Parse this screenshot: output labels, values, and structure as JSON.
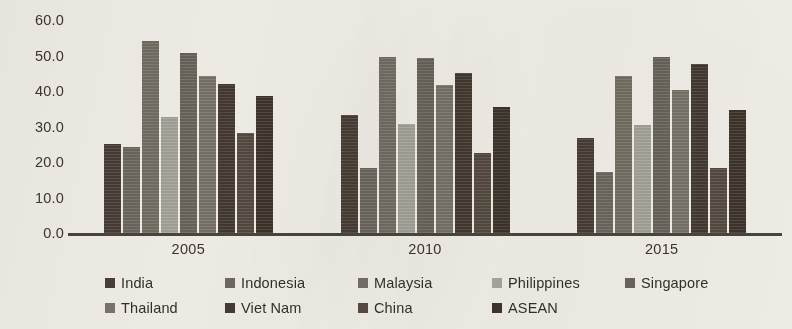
{
  "chart_data": {
    "type": "bar",
    "title": "",
    "subtitle": "",
    "xlabel": "",
    "ylabel": "",
    "categories": [
      "2005",
      "2010",
      "2015"
    ],
    "ylim": [
      0,
      60
    ],
    "ytick_labels": [
      "60.0",
      "50.0",
      "40.0",
      "30.0",
      "20.0",
      "10.0",
      "0.0"
    ],
    "ytick_values": [
      60,
      50,
      40,
      30,
      20,
      10,
      0
    ],
    "ytick_step": 10,
    "grid": false,
    "legend_position": "bottom",
    "series": [
      {
        "name": "India",
        "color": "#4a3f36",
        "values": [
          25.2,
          33.3,
          26.8
        ]
      },
      {
        "name": "Indonesia",
        "color": "#6f6a60",
        "values": [
          24.3,
          18.4,
          17.2
        ]
      },
      {
        "name": "Malaysia",
        "color": "#767166",
        "values": [
          54.0,
          49.5,
          44.2
        ]
      },
      {
        "name": "Philippines",
        "color": "#a9a79c",
        "values": [
          32.8,
          30.6,
          30.3
        ]
      },
      {
        "name": "Singapore",
        "color": "#6b665c",
        "values": [
          50.8,
          49.4,
          49.6
        ]
      },
      {
        "name": "Thailand",
        "color": "#7b766b",
        "values": [
          44.3,
          41.8,
          40.2
        ]
      },
      {
        "name": "Viet Nam",
        "color": "#453b32",
        "values": [
          42.0,
          45.2,
          47.7
        ]
      },
      {
        "name": "China",
        "color": "#574c42",
        "values": [
          28.3,
          22.4,
          18.3
        ]
      },
      {
        "name": "ASEAN",
        "color": "#3f352c",
        "values": [
          38.6,
          35.5,
          34.6
        ]
      }
    ]
  },
  "axis": {
    "baseline_color": "#4a463f"
  },
  "legend": {
    "rows": [
      [
        "India",
        "Indonesia",
        "Malaysia",
        "Philippines",
        "Singapore"
      ],
      [
        "Thailand",
        "Viet Nam",
        "China",
        "ASEAN"
      ]
    ]
  }
}
